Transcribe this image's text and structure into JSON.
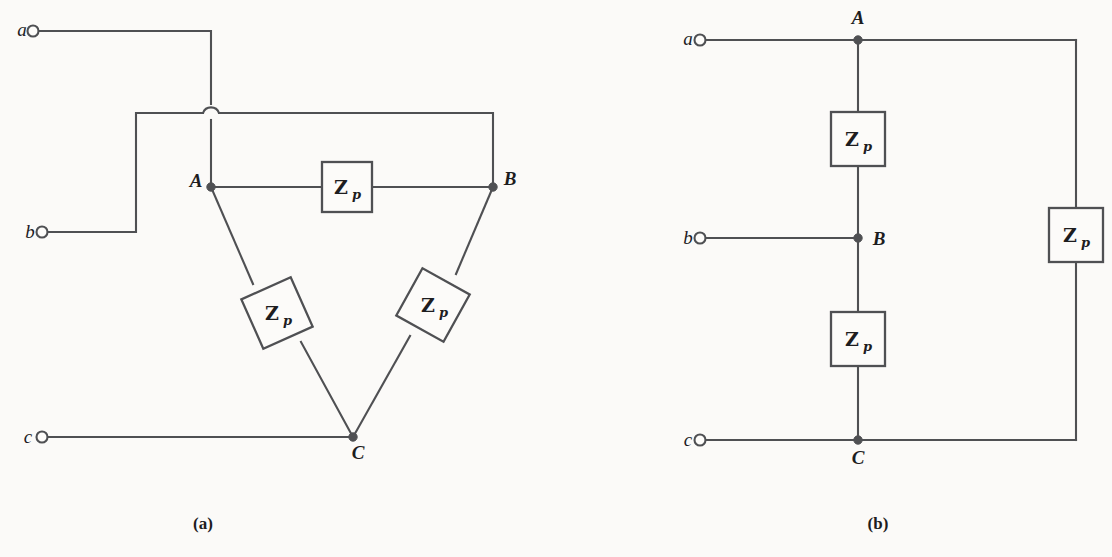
{
  "figure": {
    "background_color": "#fbfaf8",
    "line_color": "#4f5053",
    "text_color": "#1d1d1f"
  },
  "impedance_symbol": {
    "main": "Z",
    "subscript": "p"
  },
  "panel_a": {
    "caption": "(a)",
    "caption_pos": {
      "x": 203,
      "y": 529
    },
    "connection_type": "delta",
    "terminals": [
      {
        "id": "a",
        "label": "a",
        "label_pos": {
          "x": 22,
          "y": 35
        },
        "ring": {
          "cx": 33,
          "cy": 31,
          "r": 5.5
        }
      },
      {
        "id": "b",
        "label": "b",
        "label_pos": {
          "x": 30,
          "y": 238
        },
        "ring": {
          "cx": 42,
          "cy": 232,
          "r": 5.5
        }
      },
      {
        "id": "c",
        "label": "c",
        "label_pos": {
          "x": 28,
          "y": 443
        },
        "ring": {
          "cx": 42,
          "cy": 437,
          "r": 5.5
        }
      }
    ],
    "nodes": [
      {
        "id": "A",
        "label": "A",
        "x": 211,
        "y": 187,
        "label_pos": {
          "x": 196,
          "y": 187
        },
        "r": 4.2
      },
      {
        "id": "B",
        "label": "B",
        "x": 493,
        "y": 187,
        "label_pos": {
          "x": 510,
          "y": 185
        },
        "r": 4.2
      },
      {
        "id": "C",
        "label": "C",
        "x": 353,
        "y": 437,
        "label_pos": {
          "x": 358,
          "y": 459
        },
        "r": 4.2
      }
    ],
    "wires": [
      {
        "name": "lead-a",
        "points": "38.5,31 211,31 211,104"
      },
      {
        "name": "lead-a-lower",
        "points": "211,120 211,187"
      },
      {
        "name": "lead-b",
        "points": "47.5,232 136,232 136,113 203,113"
      },
      {
        "name": "lead-b-to-B",
        "points": "219,113 493,113 493,187"
      },
      {
        "name": "lead-c",
        "points": "47.5,437 353,437"
      },
      {
        "name": "leg-AB-left",
        "points": "211,187 322,187"
      },
      {
        "name": "leg-AB-right",
        "points": "372,187 493,187"
      },
      {
        "name": "leg-AC-upper",
        "points": "211,187 253,284"
      },
      {
        "name": "leg-AC-lower",
        "points": "301,342 353,437"
      },
      {
        "name": "leg-BC-upper",
        "points": "493,187 456,274"
      },
      {
        "name": "leg-BC-lower",
        "points": "410,336 353,437"
      }
    ],
    "hop": {
      "name": "wire-hop-over-lead-a",
      "path": "M 203,113 A 8.5 8.5 0 0 1 219,113",
      "cx": 211,
      "cy": 113
    },
    "impedances": [
      {
        "id": "zp-AB",
        "orientation": "horizontal",
        "rotation": 0,
        "cx": 347,
        "cy": 187,
        "w": 50,
        "h": 50
      },
      {
        "id": "zp-AC",
        "orientation": "diagonal",
        "rotation": 66,
        "cx": 277,
        "cy": 313,
        "w": 54,
        "h": 54
      },
      {
        "id": "zp-BC",
        "orientation": "diagonal",
        "rotation": -61,
        "cx": 433,
        "cy": 305,
        "w": 54,
        "h": 54
      }
    ]
  },
  "panel_b": {
    "caption": "(b)",
    "caption_pos": {
      "x": 878,
      "y": 529
    },
    "connection_type": "series-chain",
    "terminals": [
      {
        "id": "a",
        "label": "a",
        "label_pos": {
          "x": 687,
          "y": 44
        },
        "ring": {
          "cx": 700,
          "cy": 40,
          "r": 5.5
        }
      },
      {
        "id": "b",
        "label": "b",
        "label_pos": {
          "x": 687,
          "y": 244
        },
        "ring": {
          "cx": 700,
          "cy": 238,
          "r": 5.5
        }
      },
      {
        "id": "c",
        "label": "c",
        "label_pos": {
          "x": 687,
          "y": 446
        },
        "ring": {
          "cx": 700,
          "cy": 440,
          "r": 5.5
        }
      }
    ],
    "nodes": [
      {
        "id": "A",
        "label": "A",
        "x": 858,
        "y": 40,
        "label_pos": {
          "x": 858,
          "y": 24
        },
        "r": 4.2
      },
      {
        "id": "B",
        "label": "B",
        "x": 858,
        "y": 238,
        "label_pos": {
          "x": 875,
          "y": 245
        },
        "r": 4.2
      },
      {
        "id": "C",
        "label": "C",
        "x": 858,
        "y": 440,
        "label_pos": {
          "x": 858,
          "y": 464
        },
        "r": 4.2
      }
    ],
    "wires": [
      {
        "name": "lead-a",
        "points": "705.5,40 858,40"
      },
      {
        "name": "lead-b",
        "points": "705.5,238 858,238"
      },
      {
        "name": "lead-c",
        "points": "705.5,440 858,440"
      },
      {
        "name": "branch-A-to-zp1",
        "points": "858,40 858,112"
      },
      {
        "name": "branch-zp1-to-B",
        "points": "858,166 858,238"
      },
      {
        "name": "branch-B-to-zp2",
        "points": "858,238 858,312"
      },
      {
        "name": "branch-zp2-to-C",
        "points": "858,366 858,440"
      },
      {
        "name": "outer-top",
        "points": "858,40 1076,40"
      },
      {
        "name": "outer-right-upper",
        "points": "1076,40 1076,208"
      },
      {
        "name": "outer-right-lower",
        "points": "1076,262 1076,440"
      },
      {
        "name": "outer-bottom",
        "points": "1076,440 858,440"
      }
    ],
    "impedances": [
      {
        "id": "zp-AB",
        "orientation": "vertical",
        "rotation": 0,
        "cx": 858,
        "cy": 139,
        "w": 54,
        "h": 54
      },
      {
        "id": "zp-BC",
        "orientation": "vertical",
        "rotation": 0,
        "cx": 858,
        "cy": 339,
        "w": 54,
        "h": 54
      },
      {
        "id": "zp-CA",
        "orientation": "vertical",
        "rotation": 0,
        "cx": 1076,
        "cy": 235,
        "w": 54,
        "h": 54
      }
    ]
  }
}
